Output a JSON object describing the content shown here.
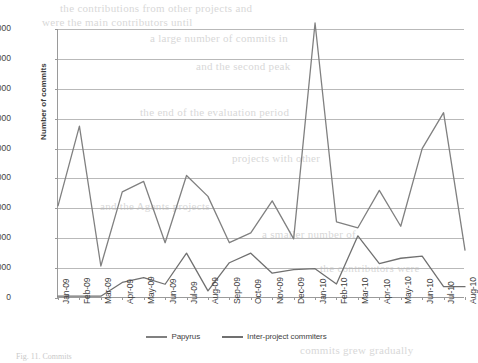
{
  "chart_data": {
    "type": "line",
    "title": "",
    "xlabel": "",
    "ylabel": "Number of commits",
    "ylim": [
      0,
      9000
    ],
    "ytick_step": 1000,
    "yticks": [
      "0",
      "1000",
      "2000",
      "3000",
      "4000",
      "5000",
      "6000",
      "7000",
      "8000",
      "9000"
    ],
    "grid": true,
    "legend_position": "bottom",
    "categories": [
      "Jan-09",
      "Feb-09",
      "Mar-09",
      "Apr-09",
      "May-09",
      "Jun-09",
      "Jul-09",
      "Aug-09",
      "Sep-09",
      "Oct-09",
      "Nov-09",
      "Dec-09",
      "Jan-10",
      "Feb-10",
      "Mar-10",
      "Apr-10",
      "May-10",
      "Jun-10",
      "Jul-10",
      "Aug-10"
    ],
    "series": [
      {
        "name": "Papyrus",
        "color": "#808080",
        "values": [
          3080,
          5750,
          1070,
          3550,
          3900,
          1850,
          4100,
          3400,
          1850,
          2180,
          3250,
          1980,
          9200,
          2550,
          2350,
          3600,
          2400,
          5000,
          6200,
          1600
        ]
      },
      {
        "name": "Inter-project commiters",
        "color": "#707070",
        "values": [
          60,
          60,
          60,
          520,
          680,
          460,
          1500,
          240,
          1180,
          1500,
          830,
          950,
          980,
          470,
          2080,
          1150,
          1330,
          1400,
          380,
          380
        ]
      }
    ]
  },
  "legend": {
    "items": [
      {
        "label": "Papyrus",
        "color": "#808080"
      },
      {
        "label": "Inter-project commiters",
        "color": "#707070"
      }
    ]
  },
  "caption": "Fig. 11. Commits",
  "bleed_text": {
    "lines": [
      "the contributions from other projects and",
      "were the main contributors until",
      "a large number of commits in",
      "and the second peak",
      "the end of the evaluation period",
      "projects with other",
      "and the Agents projects",
      "a smaller number of",
      "the contributors were",
      "commits grew gradually"
    ]
  }
}
